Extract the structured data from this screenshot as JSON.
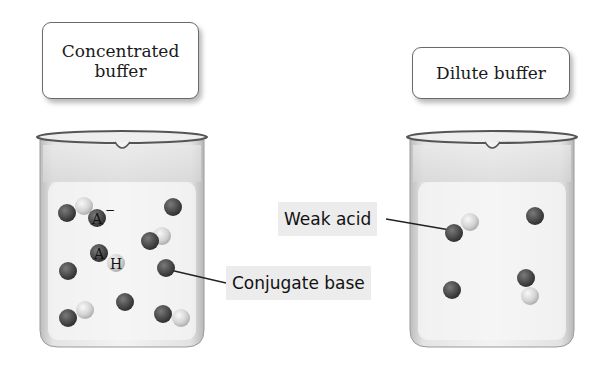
{
  "beakers": [
    {
      "id": "concentrated",
      "label": [
        "Concentrated",
        "buffer"
      ],
      "molecules": [
        {
          "type": "weak-acid",
          "atoms": [
            {
              "x": 67,
              "y": 213,
              "kind": "A"
            },
            {
              "x": 84,
              "y": 206,
              "kind": "H"
            }
          ]
        },
        {
          "type": "conjugate-base",
          "atoms": [
            {
              "x": 173,
              "y": 207,
              "kind": "A"
            }
          ]
        },
        {
          "type": "conjugate-base-labeled",
          "atoms": [
            {
              "x": 97,
              "y": 218,
              "kind": "A",
              "text": "A",
              "charge": "−"
            }
          ]
        },
        {
          "type": "weak-acid",
          "atoms": [
            {
              "x": 150,
              "y": 241,
              "kind": "A"
            },
            {
              "x": 162,
              "y": 236,
              "kind": "H"
            }
          ]
        },
        {
          "type": "weak-acid-labeled",
          "atoms": [
            {
              "x": 99,
              "y": 253,
              "kind": "A",
              "text": "A"
            },
            {
              "x": 116,
              "y": 263,
              "kind": "H",
              "text": "H"
            }
          ]
        },
        {
          "type": "conjugate-base",
          "atoms": [
            {
              "x": 68,
              "y": 271,
              "kind": "A"
            }
          ]
        },
        {
          "type": "conjugate-base",
          "atoms": [
            {
              "x": 166,
              "y": 268,
              "kind": "A"
            }
          ]
        },
        {
          "type": "weak-acid",
          "atoms": [
            {
              "x": 68,
              "y": 318,
              "kind": "A"
            },
            {
              "x": 85,
              "y": 310,
              "kind": "H"
            }
          ]
        },
        {
          "type": "conjugate-base",
          "atoms": [
            {
              "x": 125,
              "y": 302,
              "kind": "A"
            }
          ]
        },
        {
          "type": "weak-acid",
          "atoms": [
            {
              "x": 163,
              "y": 314,
              "kind": "A"
            },
            {
              "x": 181,
              "y": 318,
              "kind": "H"
            }
          ]
        }
      ]
    },
    {
      "id": "dilute",
      "label": [
        "Dilute buffer"
      ],
      "molecules": [
        {
          "type": "weak-acid",
          "atoms": [
            {
              "x": 454,
              "y": 233,
              "kind": "A"
            },
            {
              "x": 470,
              "y": 222,
              "kind": "H"
            }
          ]
        },
        {
          "type": "conjugate-base",
          "atoms": [
            {
              "x": 535,
              "y": 216,
              "kind": "A"
            }
          ]
        },
        {
          "type": "conjugate-base",
          "atoms": [
            {
              "x": 452,
              "y": 290,
              "kind": "A"
            }
          ]
        },
        {
          "type": "weak-acid",
          "atoms": [
            {
              "x": 526,
              "y": 278,
              "kind": "A"
            },
            {
              "x": 530,
              "y": 296,
              "kind": "H"
            }
          ]
        }
      ]
    }
  ],
  "callouts": {
    "weak_acid": {
      "text": "Weak acid",
      "line": {
        "x1": 386,
        "y1": 219,
        "x2": 450,
        "y2": 230
      }
    },
    "conjugate_base": {
      "text": "Conjugate base",
      "line": {
        "x1": 170,
        "y1": 270,
        "x2": 226,
        "y2": 283
      }
    }
  },
  "labels": {
    "concentrated_line1": "Concentrated",
    "concentrated_line2": "buffer",
    "dilute": "Dilute buffer",
    "anion_symbol": "A",
    "anion_charge": "−",
    "acid_a": "A",
    "acid_h": "H"
  },
  "colors": {
    "atom_A": "#4a4a4a",
    "atom_H": "#dcdcdc",
    "beaker_glass": "#e6e6e6",
    "beaker_rim": "#555555",
    "tag_bg": "#ececec",
    "line": "#222222"
  }
}
